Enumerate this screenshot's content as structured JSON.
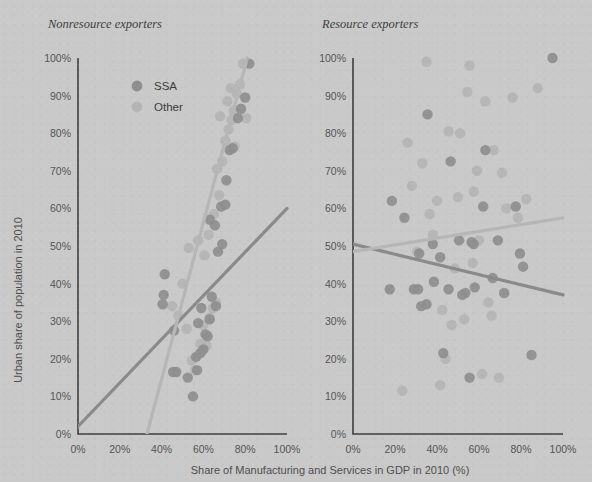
{
  "figure": {
    "xlabel": "Share of Manufacturing and Services in GDP in 2010 (%)",
    "ylabel": "Urban share of population in 2010",
    "legend": [
      {
        "key": "ssa",
        "label": "SSA",
        "color": "#8e8e8e"
      },
      {
        "key": "other",
        "label": "Other",
        "color": "#b4b4b4"
      }
    ],
    "background_color": "#c9c9c9",
    "axis_color": "#3f3f3f"
  },
  "chart_data": [
    {
      "type": "scatter",
      "title": "Nonresource exporters",
      "xlabel": "Share of Manufacturing and Services in GDP in 2010 (%)",
      "ylabel": "Urban share of population in 2010",
      "xlim": [
        0,
        100
      ],
      "ylim": [
        0,
        100
      ],
      "xticks": [
        "0%",
        "20%",
        "40%",
        "60%",
        "80%",
        "100%"
      ],
      "xtick_values": [
        0,
        20,
        40,
        60,
        80,
        100
      ],
      "yticks": [
        "0%",
        "10%",
        "20%",
        "30%",
        "40%",
        "50%",
        "60%",
        "70%",
        "80%",
        "90%",
        "100%"
      ],
      "ytick_values": [
        0,
        10,
        20,
        30,
        40,
        50,
        60,
        70,
        80,
        90,
        100
      ],
      "grid": false,
      "legend_position": "upper-left-inside",
      "series": [
        {
          "name": "SSA",
          "color": "#8e8e8e",
          "points": [
            [
              41.5,
              42.5
            ],
            [
              41.0,
              37.0
            ],
            [
              40.5,
              34.5
            ],
            [
              46.0,
              27.5
            ],
            [
              45.5,
              16.5
            ],
            [
              47.0,
              16.5
            ],
            [
              52.5,
              15.0
            ],
            [
              55.0,
              10.0
            ],
            [
              56.5,
              20.5
            ],
            [
              58.5,
              21.5
            ],
            [
              60.0,
              22.5
            ],
            [
              57.0,
              17.0
            ],
            [
              61.0,
              26.5
            ],
            [
              62.0,
              26.0
            ],
            [
              57.5,
              29.5
            ],
            [
              63.0,
              30.5
            ],
            [
              59.0,
              33.5
            ],
            [
              66.0,
              34.0
            ],
            [
              64.0,
              36.5
            ],
            [
              67.0,
              48.5
            ],
            [
              69.0,
              50.5
            ],
            [
              65.5,
              55.5
            ],
            [
              68.5,
              60.5
            ],
            [
              70.5,
              61.0
            ],
            [
              63.0,
              57.0
            ],
            [
              71.0,
              67.5
            ],
            [
              72.5,
              75.5
            ],
            [
              74.0,
              76.0
            ],
            [
              76.5,
              84.0
            ],
            [
              78.0,
              86.5
            ],
            [
              80.0,
              89.5
            ],
            [
              82.0,
              98.5
            ]
          ]
        },
        {
          "name": "Other",
          "color": "#b4b4b4",
          "points": [
            [
              45.0,
              34.0
            ],
            [
              48.0,
              31.5
            ],
            [
              50.0,
              40.0
            ],
            [
              52.0,
              28.0
            ],
            [
              54.5,
              19.5
            ],
            [
              56.0,
              17.0
            ],
            [
              58.5,
              24.0
            ],
            [
              60.0,
              29.0
            ],
            [
              61.5,
              23.5
            ],
            [
              63.0,
              31.0
            ],
            [
              64.5,
              33.5
            ],
            [
              66.0,
              35.0
            ],
            [
              53.0,
              49.5
            ],
            [
              57.5,
              51.5
            ],
            [
              60.5,
              47.5
            ],
            [
              62.5,
              53.0
            ],
            [
              65.0,
              58.5
            ],
            [
              67.5,
              63.5
            ],
            [
              66.5,
              70.5
            ],
            [
              69.0,
              72.5
            ],
            [
              70.5,
              78.0
            ],
            [
              72.0,
              81.0
            ],
            [
              73.5,
              83.5
            ],
            [
              74.5,
              86.0
            ],
            [
              71.5,
              88.5
            ],
            [
              76.0,
              90.5
            ],
            [
              77.5,
              93.0
            ],
            [
              79.0,
              98.5
            ],
            [
              75.0,
              76.5
            ],
            [
              68.0,
              84.5
            ],
            [
              73.0,
              92.0
            ],
            [
              80.5,
              84.0
            ]
          ]
        }
      ],
      "trendlines": [
        {
          "name": "SSA",
          "color": "#8a8a8a",
          "x": [
            0,
            100
          ],
          "y": [
            2,
            60
          ]
        },
        {
          "name": "Other",
          "color": "#b6b6b6",
          "x": [
            33,
            81
          ],
          "y": [
            0,
            100
          ]
        }
      ]
    },
    {
      "type": "scatter",
      "title": "Resource exporters",
      "xlabel": "Share of Manufacturing and Services in GDP in 2010 (%)",
      "ylabel": "Urban share of population in 2010",
      "xlim": [
        0,
        100
      ],
      "ylim": [
        0,
        100
      ],
      "xticks": [
        "0%",
        "20%",
        "40%",
        "60%",
        "80%",
        "100%"
      ],
      "xtick_values": [
        0,
        20,
        40,
        60,
        80,
        100
      ],
      "yticks": [
        "0%",
        "10%",
        "20%",
        "30%",
        "40%",
        "50%",
        "60%",
        "70%",
        "80%",
        "90%",
        "100%"
      ],
      "ytick_values": [
        0,
        10,
        20,
        30,
        40,
        50,
        60,
        70,
        80,
        90,
        100
      ],
      "grid": false,
      "legend_position": "none",
      "series": [
        {
          "name": "SSA",
          "color": "#8e8e8e",
          "points": [
            [
              17.5,
              38.5
            ],
            [
              18.5,
              62.0
            ],
            [
              24.5,
              57.5
            ],
            [
              29.0,
              38.5
            ],
            [
              31.0,
              38.5
            ],
            [
              31.5,
              48.0
            ],
            [
              32.5,
              34.0
            ],
            [
              35.0,
              34.5
            ],
            [
              35.5,
              85.0
            ],
            [
              38.5,
              40.5
            ],
            [
              38.0,
              50.5
            ],
            [
              41.5,
              47.0
            ],
            [
              43.0,
              21.5
            ],
            [
              45.5,
              38.5
            ],
            [
              50.5,
              51.5
            ],
            [
              52.0,
              37.0
            ],
            [
              53.5,
              37.5
            ],
            [
              55.5,
              15.0
            ],
            [
              56.5,
              51.0
            ],
            [
              57.5,
              50.5
            ],
            [
              58.0,
              39.0
            ],
            [
              62.0,
              60.5
            ],
            [
              66.5,
              41.5
            ],
            [
              69.0,
              51.5
            ],
            [
              72.0,
              37.5
            ],
            [
              77.5,
              60.5
            ],
            [
              79.5,
              48.0
            ],
            [
              81.0,
              44.5
            ],
            [
              85.0,
              21.0
            ],
            [
              46.5,
              72.5
            ],
            [
              63.0,
              75.5
            ],
            [
              95.0,
              100.0
            ]
          ]
        },
        {
          "name": "Other",
          "color": "#b4b4b4",
          "points": [
            [
              23.5,
              11.5
            ],
            [
              26.0,
              77.5
            ],
            [
              28.0,
              66.0
            ],
            [
              30.5,
              48.5
            ],
            [
              33.0,
              72.0
            ],
            [
              35.0,
              99.0
            ],
            [
              36.5,
              58.5
            ],
            [
              38.0,
              53.0
            ],
            [
              40.0,
              62.0
            ],
            [
              41.5,
              13.0
            ],
            [
              42.5,
              33.0
            ],
            [
              44.0,
              20.0
            ],
            [
              45.5,
              80.5
            ],
            [
              47.0,
              29.0
            ],
            [
              48.5,
              44.0
            ],
            [
              50.0,
              63.0
            ],
            [
              51.0,
              80.0
            ],
            [
              53.0,
              30.5
            ],
            [
              54.5,
              91.0
            ],
            [
              55.5,
              98.0
            ],
            [
              57.0,
              45.5
            ],
            [
              59.0,
              70.0
            ],
            [
              60.0,
              51.5
            ],
            [
              61.5,
              16.0
            ],
            [
              63.0,
              88.5
            ],
            [
              64.5,
              35.0
            ],
            [
              66.0,
              31.5
            ],
            [
              67.0,
              75.5
            ],
            [
              69.5,
              15.0
            ],
            [
              71.0,
              69.5
            ],
            [
              73.0,
              60.0
            ],
            [
              76.0,
              89.5
            ],
            [
              78.5,
              57.5
            ],
            [
              82.5,
              62.5
            ],
            [
              88.0,
              92.0
            ],
            [
              57.5,
              64.5
            ]
          ]
        }
      ],
      "trendlines": [
        {
          "name": "SSA",
          "color": "#8a8a8a",
          "x": [
            0,
            100
          ],
          "y": [
            50.5,
            37.0
          ]
        },
        {
          "name": "Other",
          "color": "#b6b6b6",
          "x": [
            0,
            100
          ],
          "y": [
            48.5,
            57.5
          ]
        }
      ]
    }
  ]
}
